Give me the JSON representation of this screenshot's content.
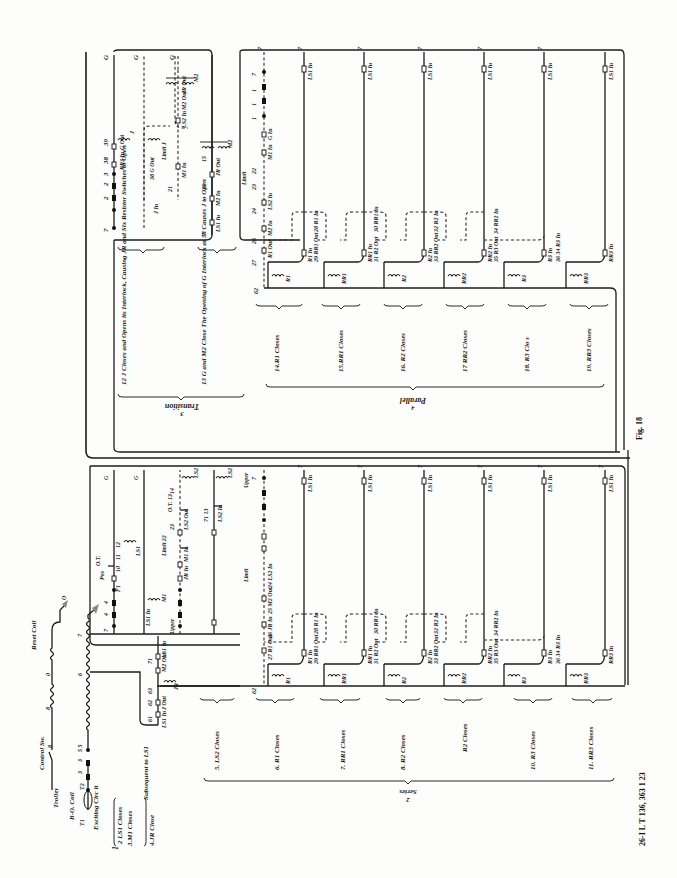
{
  "figure": {
    "label": "Fig. 18",
    "footer": "26-I L T 136, 363  1 23"
  },
  "sections": {
    "series": {
      "number": "2",
      "title": "Series"
    },
    "transition": {
      "number": "3",
      "title": "Transition"
    },
    "parallel": {
      "number": "4",
      "title": "Parallel"
    }
  },
  "exciting_circuit": {
    "trolley": "Trolley",
    "control_sw": "Control Sw.",
    "bo_coil": "B-O. Coil",
    "t1": "T1",
    "t2": "T2",
    "exciting_circuit": "Exciting Circ it",
    "reset_coil": "Reset Coil",
    "ground_o": "O",
    "wire_8a": "8",
    "wire_8b": "8",
    "wire_0": "0",
    "wire_3a": "3",
    "wire_3b": "3",
    "wire_5": "5 5",
    "wire_6": "6",
    "wire_7": "7"
  },
  "series_steps": [
    {
      "label": "2 LS1 Closes"
    },
    {
      "label": "3.M1 Closes"
    },
    {
      "label": "4.JR Close"
    },
    {
      "label": "Subsequent to LS1"
    },
    {
      "label": "5. LS2 Closes"
    },
    {
      "label": "6. R1 Closes"
    },
    {
      "label": "7. RR1 Closes"
    },
    {
      "label": "8. R2 Closes"
    },
    {
      "label": "R2 Closes"
    },
    {
      "label": "10. R3 Closes"
    },
    {
      "label": "11. RR3 Closes"
    }
  ],
  "transition_steps": [
    {
      "label": "12  J Closes and Opens its Interlock, Causing JR and Six Resistor Switches to Open"
    },
    {
      "label": "13 G and M2 Close The Opening of G Interlock at 38 Causes J to Open"
    }
  ],
  "parallel_steps": [
    {
      "label": "14.R1 Closes"
    },
    {
      "label": "15.RR1 Closes"
    },
    {
      "label": "16. R2 Closes"
    },
    {
      "label": "17 RR2 Closes"
    },
    {
      "label": "18. R3 Clo  s"
    },
    {
      "label": "19. RR3 Closes"
    }
  ],
  "wire_labels": {
    "g": "G",
    "seven": "7",
    "sixtytwo": "62",
    "limit": "Limit",
    "upper": "Upper",
    "ot": "O.T.",
    "pos": "Pos",
    "in": "In",
    "out": "Out"
  },
  "series_upper": {
    "nodes": [
      "7",
      "4",
      "4",
      "F1",
      "F1",
      "10",
      "11",
      "12"
    ],
    "contacts": [
      "LS1 In",
      "M1",
      "LS1",
      "J",
      "JR In",
      "M1 In",
      "Limit 22",
      "23",
      "LS2 Out",
      "O.T. 13",
      "14",
      "71 13",
      "LS2 In"
    ],
    "coils": [
      "LS1",
      "M1",
      "LS2",
      "LS2"
    ]
  },
  "resistor_rows": [
    {
      "contacts": [
        "27 R1 Out",
        "26 JR In",
        "25 M2 Out",
        "24 LS2 In",
        "23"
      ],
      "coil": "R1",
      "feed": "R1 In"
    },
    {
      "contacts": [
        "29 RR1 Out",
        "28 R1 In"
      ],
      "coil": "RR1",
      "feed": "RR1 In"
    },
    {
      "contacts": [
        "31 R2 Out",
        "30 RR1 In"
      ],
      "coil": "R2",
      "feed": "R2 In"
    },
    {
      "contacts": [
        "33 RR2 Out",
        "32 R2 In"
      ],
      "coil": "RR2",
      "feed": "RR2 In"
    },
    {
      "contacts": [
        "35 R3 Out",
        "34 RR2 In"
      ],
      "coil": "R3",
      "feed": "R3 In"
    },
    {
      "contacts": [
        "36 34 R3 In"
      ],
      "coil": "RR3",
      "feed": "RR3 In"
    }
  ],
  "ls1_feeds": [
    "LS1 In",
    "LS1 In",
    "LS1 In",
    "LS1 In",
    "LS1 In",
    "LS1 In"
  ],
  "jr_circuit": {
    "nodes": [
      "61",
      "62",
      "63",
      "71"
    ],
    "contacts": [
      "LS1 In",
      "J Out",
      "M2 Out",
      "LS1 In"
    ],
    "coil": "JR"
  },
  "transition_circuit": {
    "upper_nodes": [
      "7",
      "7",
      "2",
      "2",
      "3",
      "38",
      "39"
    ],
    "contacts": [
      "RR3 In",
      "G Out",
      "J In",
      "38 G Out",
      "39",
      "M1 In",
      "21",
      "22",
      "Limit J",
      "23",
      "LS2 In",
      "24",
      "M2 Out",
      "25",
      "JR Out",
      "LS"
    ],
    "lower": [
      "7",
      "LS1 In",
      "M2 In",
      "35",
      "JR Out",
      "15"
    ],
    "coils": [
      "J",
      "G",
      "M2",
      "G",
      "M2"
    ]
  },
  "parallel_upper": {
    "nodes": [
      "7",
      "7",
      "1",
      "1",
      "1",
      "1",
      "G In",
      "M1 In",
      "22",
      "23",
      "LS2 In",
      "24",
      "M2 In",
      "26",
      "R1 Out",
      "27"
    ],
    "limit": "Limit"
  }
}
